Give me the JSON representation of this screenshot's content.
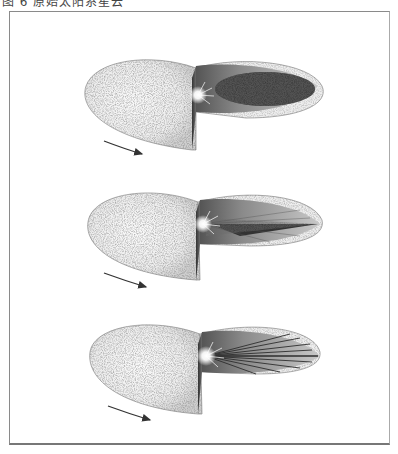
{
  "caption": "图 6  原始太阳系星云",
  "figure": {
    "panels": [
      {
        "name": "stage-1",
        "description": "Rotating nebula disk with dense dark inner region",
        "rotation_arrow": true,
        "core_style": "dense-ellipse"
      },
      {
        "name": "stage-2",
        "description": "Flattening nebula with central star beginning to form, radial streaks",
        "rotation_arrow": true,
        "core_style": "wedge-streaks"
      },
      {
        "name": "stage-3",
        "description": "Flattened disk with bright central sun and radiating streaks",
        "rotation_arrow": true,
        "core_style": "radial-rays"
      }
    ]
  },
  "colors": {
    "frame": "#8a8a8a",
    "disk_fill": "#f2f2f2",
    "speckle": "#3a3a3a",
    "core_dark": "#2e2e2e",
    "arrow": "#333333"
  }
}
